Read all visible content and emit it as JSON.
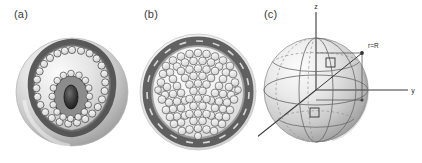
{
  "figure": {
    "background_color": "#ffffff",
    "width": 422,
    "height": 163,
    "panels": [
      {
        "id": "a",
        "label": "(a)",
        "caption_position": "top-left",
        "description": "Shaded spherical cross-section showing an irregular dark annular band studded with small light circles, enclosing an inner dark oval core ringed by further light circles."
      },
      {
        "id": "b",
        "label": "(b)",
        "caption_position": "top-left",
        "description": "Circular cross-section densely packed with many small light circles, bounded by a thick dark irregular outer ring."
      },
      {
        "id": "c",
        "label": "(c)",
        "caption_position": "top-left",
        "description": "Shaded three-dimensional sphere with Cartesian axes x, y, z through its centre, latitude and longitude curves drawn on the surface, two small square surface elements marked, and a radial vector to a surface point labelled r=R."
      }
    ]
  },
  "panel_c": {
    "axes": [
      {
        "name": "z-axis",
        "label": "z",
        "direction": "up"
      },
      {
        "name": "y-axis",
        "label": "y",
        "direction": "right"
      },
      {
        "name": "x-axis",
        "label": "x",
        "direction": "lower-left"
      }
    ],
    "annotations": [
      {
        "name": "radius-label",
        "label": "r=R"
      }
    ],
    "markers": [
      {
        "name": "surface-element-upper",
        "shape": "square"
      },
      {
        "name": "surface-element-lower",
        "shape": "square"
      }
    ],
    "colors": {
      "sphere_light": "#f4f4f4",
      "sphere_mid": "#c9c9c9",
      "sphere_shadow": "#9a9a9a",
      "line": "#4a4a4a",
      "axis": "#3a3a3a"
    }
  },
  "palette": {
    "ink": "#2b2b2b",
    "dark_band": "#4a4a4a",
    "mid_gray": "#8e8e8e",
    "light_gray": "#d8d8d8",
    "cell_fill": "#e9e9e9",
    "core_dark": "#1a1a1a",
    "background": "#ffffff"
  }
}
